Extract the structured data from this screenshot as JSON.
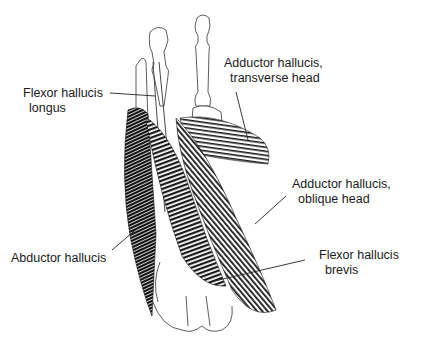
{
  "figure": {
    "labels": {
      "flexor_hallucis_longus": {
        "line1": "Flexor hallucis",
        "line2": "longus"
      },
      "adductor_transverse": {
        "line1": "Adductor hallucis,",
        "line2": "transverse head"
      },
      "adductor_oblique": {
        "line1": "Adductor hallucis,",
        "line2": "oblique head"
      },
      "abductor_hallucis": {
        "line1": "Abductor hallucis"
      },
      "flexor_hallucis_brevis": {
        "line1": "Flexor hallucis",
        "line2": "brevis"
      }
    },
    "colors": {
      "ink": "#1a1a1a",
      "background": "#ffffff"
    }
  }
}
